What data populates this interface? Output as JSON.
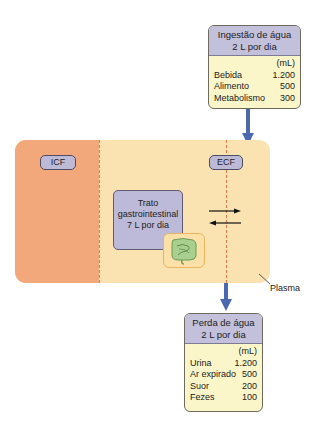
{
  "intake": {
    "title_line1": "Ingestão de água",
    "title_line2": "2 L por dia",
    "unit": "(mL)",
    "rows": [
      {
        "label": "Bebida",
        "value": "1.200"
      },
      {
        "label": "Alimento",
        "value": "500"
      },
      {
        "label": "Metabolismo",
        "value": "300"
      }
    ]
  },
  "compartments": {
    "icf_label": "ICF",
    "ecf_label": "ECF",
    "plasma_label": "Plasma"
  },
  "gi_tract": {
    "line1": "Trato",
    "line2": "gastrointestinal",
    "line3": "7 L por dia",
    "icon": "intestine-icon"
  },
  "exchange_arrows": [
    "arrow-right",
    "arrow-left"
  ],
  "loss": {
    "title_line1": "Perda de água",
    "title_line2": "2 L por dia",
    "unit": "(mL)",
    "rows": [
      {
        "label": "Urina",
        "value": "1.200"
      },
      {
        "label": "Ar expirado",
        "value": "500"
      },
      {
        "label": "Suor",
        "value": "200"
      },
      {
        "label": "Fezes",
        "value": "100"
      }
    ]
  },
  "colors": {
    "icf": "#f2a87b",
    "ecf": "#fae3b1",
    "header": "#c3c0db",
    "box_body": "#fbf6c9",
    "arrow": "#4a69b0",
    "dash": "#e27a4a"
  }
}
